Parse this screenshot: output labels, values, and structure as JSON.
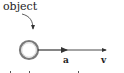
{
  "diagram": {
    "object_label": "object",
    "vector_labels": {
      "acceleration": "a",
      "velocity": "v"
    },
    "colors": {
      "line": "#333333",
      "ring_outer": "#7a7a7a",
      "ring_inner": "#d0d0d0",
      "text": "#222222"
    }
  }
}
